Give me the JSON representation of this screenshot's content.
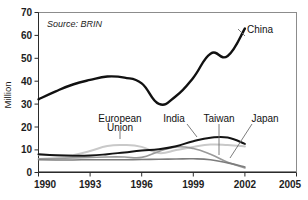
{
  "figure": {
    "cropped_title_fragment": "pg g p p",
    "source_note": "Source: BRIN",
    "width": 308,
    "height": 200
  },
  "colors": {
    "china": "#111111",
    "india": "#141414",
    "european_union": "#c9c9c9",
    "taiwan": "#9a9a9a",
    "japan": "#7d7d7d",
    "axis": "#2b2b2b",
    "frame": "#8c8c8c",
    "background": "#ffffff"
  },
  "chart_data": {
    "type": "line",
    "title": "",
    "subtitle": "",
    "annotations": [
      "Source: BRIN"
    ],
    "xlabel": "",
    "ylabel": "Million",
    "xlim": [
      1990,
      2005
    ],
    "ylim": [
      0,
      70
    ],
    "xticks": [
      1990,
      1993,
      1996,
      1999,
      2002,
      2005
    ],
    "xticklabels": [
      "1990",
      "1993",
      "1996",
      "1999",
      "2002",
      "2005"
    ],
    "yticks": [
      0,
      10,
      20,
      30,
      40,
      50,
      60,
      70
    ],
    "yticklabels": [
      "0",
      "10",
      "20",
      "30",
      "40",
      "50",
      "60",
      "70"
    ],
    "grid": false,
    "legend_position": "inline-labels",
    "x": [
      1990,
      1991,
      1992,
      1993,
      1994,
      1995,
      1996,
      1997,
      1998,
      1999,
      2000,
      2001,
      2002
    ],
    "series": [
      {
        "name": "China",
        "label": "China",
        "color": "#111111",
        "values": [
          32.0,
          35.5,
          38.5,
          40.5,
          42.0,
          41.5,
          39.0,
          30.0,
          33.5,
          41.5,
          52.0,
          51.0,
          63.0
        ]
      },
      {
        "name": "India",
        "label": "India",
        "color": "#141414",
        "values": [
          8.0,
          7.5,
          7.3,
          7.4,
          8.0,
          8.8,
          9.6,
          10.2,
          11.5,
          13.7,
          15.2,
          15.3,
          12.5
        ]
      },
      {
        "name": "European Union",
        "label": "European Union",
        "color": "#c9c9c9",
        "values": [
          7.8,
          7.5,
          7.6,
          9.4,
          11.6,
          12.0,
          11.2,
          8.5,
          9.8,
          11.2,
          12.2,
          12.0,
          11.4
        ]
      },
      {
        "name": "Taiwan",
        "label": "Taiwan",
        "color": "#9a9a9a",
        "values": [
          6.0,
          6.2,
          6.4,
          6.6,
          6.8,
          6.8,
          6.6,
          9.2,
          11.2,
          10.5,
          8.0,
          4.5,
          2.0
        ]
      },
      {
        "name": "Japan",
        "label": "Japan",
        "color": "#7d7d7d",
        "values": [
          5.6,
          5.5,
          5.5,
          5.6,
          5.6,
          5.6,
          5.7,
          5.8,
          5.9,
          6.0,
          5.6,
          4.2,
          2.4
        ]
      }
    ]
  }
}
